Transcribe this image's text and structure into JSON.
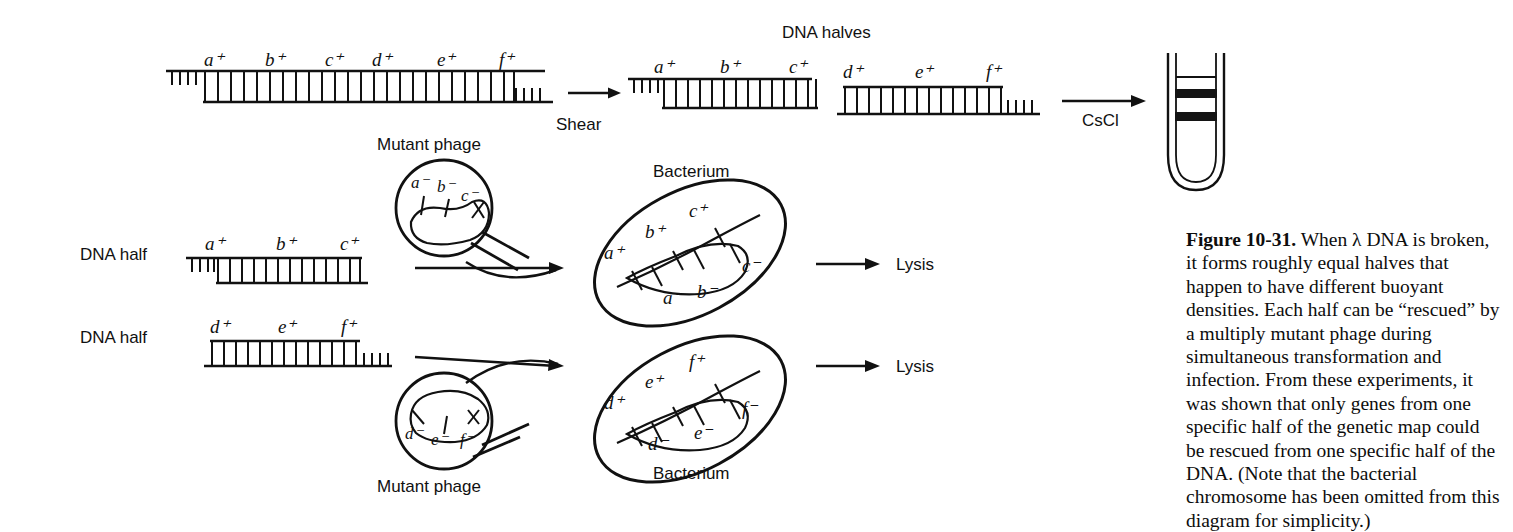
{
  "figure": {
    "number_label": "Figure 10-31.",
    "caption_body": "When λ DNA is broken, it forms roughly equal halves that happen to have different buoyant densities. Each half can be “rescued” by a multiply mutant phage during simultaneous transformation and infection. From these experiments, it was shown that only genes from one specific half of the genetic map could be rescued from one specific half of the DNA. (Note that the bacterial chromosome has been omitted from this diagram for simplicity.)",
    "lambda_symbol": "λ"
  },
  "headings": {
    "dna_halves": "DNA halves"
  },
  "top_row": {
    "intact_dna": {
      "genes": [
        "a",
        "b",
        "c",
        "d",
        "e",
        "f"
      ],
      "superscript": "+",
      "gene_labels": [
        "a⁺",
        "b⁺",
        "c⁺",
        "d⁺",
        "e⁺",
        "f⁺"
      ]
    },
    "shear_label": "Shear",
    "left_half": {
      "gene_labels": [
        "a⁺",
        "b⁺",
        "c⁺"
      ]
    },
    "right_half": {
      "gene_labels": [
        "d⁺",
        "e⁺",
        "f⁺"
      ]
    },
    "cscl_label": "CsCl",
    "centrifuge_tube": {
      "band_count": 2,
      "meniscus": true
    }
  },
  "middle_section": {
    "dna_half_label_1": "DNA half",
    "dna_half_label_2": "DNA half",
    "half_1_genes": [
      "a⁺",
      "b⁺",
      "c⁺"
    ],
    "half_2_genes": [
      "d⁺",
      "e⁺",
      "f⁺"
    ],
    "phage_1": {
      "title": "Mutant phage",
      "genes": [
        "a⁻",
        "b⁻",
        "c⁻"
      ]
    },
    "phage_2": {
      "title": "Mutant phage",
      "genes": [
        "d⁻",
        "e⁻",
        "f⁻"
      ]
    },
    "bacterium_1": {
      "title": "Bacterium",
      "donor_genes": [
        "a⁺",
        "b⁺",
        "c⁺"
      ],
      "phage_genes": [
        "a⁻",
        "b⁻",
        "c⁻"
      ],
      "outcome": "Lysis"
    },
    "bacterium_2": {
      "title": "Bacterium",
      "donor_genes": [
        "d⁺",
        "e⁺",
        "f⁺"
      ],
      "phage_genes": [
        "d⁻",
        "e⁻",
        "f⁻"
      ],
      "outcome": "Lysis"
    }
  },
  "colors": {
    "ink": "#111111",
    "background": "#ffffff",
    "band": "#141414"
  }
}
